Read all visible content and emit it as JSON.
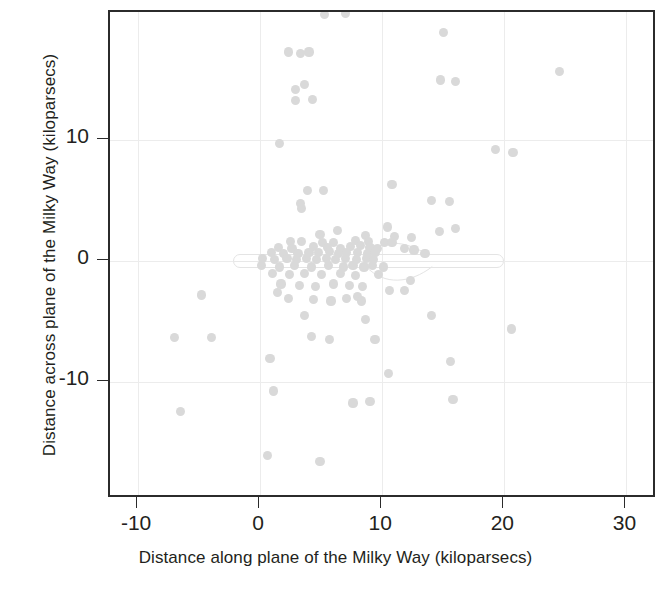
{
  "chart_data": {
    "type": "scatter",
    "title": "",
    "xlabel": "Distance along plane of the Milky Way (kiloparsecs)",
    "ylabel": "Distance across plane of the Milky Way (kiloparsecs)",
    "xlim": [
      -12.3,
      32.5
    ],
    "ylim": [
      -19.6,
      20.5
    ],
    "xticks": [
      -10,
      0,
      10,
      20,
      30
    ],
    "yticks": [
      10,
      0,
      -10
    ],
    "xticklabels": [
      "-10",
      "0",
      "10",
      "20",
      "30"
    ],
    "yticklabels": [
      "10",
      "0",
      "-10"
    ],
    "grid": true,
    "legend": null,
    "point_color": "#d9d9d9",
    "frame_color": "#2b2b2b",
    "grid_color": "#ececec",
    "overlay": {
      "name": "galactic-disk-outline",
      "shape": "elongated-capsule",
      "x_start": -2.2,
      "x_end": 20.0,
      "y_center": 0.0,
      "half_thickness": 0.55,
      "warp_feature_x": 9.5,
      "color": "#e4e4e4"
    },
    "points": [
      [
        5.3,
        20.3
      ],
      [
        7.0,
        20.4
      ],
      [
        15.0,
        18.8
      ],
      [
        2.3,
        17.2
      ],
      [
        4.0,
        17.2
      ],
      [
        3.3,
        17.1
      ],
      [
        24.5,
        15.6
      ],
      [
        16.0,
        14.8
      ],
      [
        3.6,
        14.5
      ],
      [
        14.8,
        14.9
      ],
      [
        2.9,
        14.1
      ],
      [
        4.3,
        13.3
      ],
      [
        2.9,
        13.2
      ],
      [
        1.6,
        9.7
      ],
      [
        20.7,
        8.9
      ],
      [
        19.3,
        9.2
      ],
      [
        10.8,
        6.3
      ],
      [
        3.9,
        5.8
      ],
      [
        5.2,
        5.8
      ],
      [
        14.0,
        5.0
      ],
      [
        15.5,
        4.9
      ],
      [
        3.3,
        4.7
      ],
      [
        3.4,
        4.3
      ],
      [
        16.0,
        2.7
      ],
      [
        14.7,
        2.4
      ],
      [
        10.4,
        2.8
      ],
      [
        6.3,
        2.5
      ],
      [
        4.9,
        2.2
      ],
      [
        8.6,
        2.1
      ],
      [
        11.0,
        2.0
      ],
      [
        12.4,
        1.9
      ],
      [
        2.5,
        1.6
      ],
      [
        3.4,
        1.6
      ],
      [
        5.1,
        1.5
      ],
      [
        6.0,
        1.5
      ],
      [
        7.8,
        1.7
      ],
      [
        8.9,
        1.6
      ],
      [
        10.2,
        1.5
      ],
      [
        10.8,
        1.5
      ],
      [
        1.5,
        1.1
      ],
      [
        2.6,
        1.0
      ],
      [
        4.4,
        1.2
      ],
      [
        5.5,
        1.1
      ],
      [
        6.6,
        1.0
      ],
      [
        7.4,
        1.2
      ],
      [
        8.2,
        1.3
      ],
      [
        9.0,
        1.1
      ],
      [
        9.6,
        1.0
      ],
      [
        11.8,
        1.0
      ],
      [
        12.6,
        0.9
      ],
      [
        0.9,
        0.7
      ],
      [
        1.9,
        0.6
      ],
      [
        3.1,
        0.6
      ],
      [
        4.0,
        0.7
      ],
      [
        4.8,
        0.7
      ],
      [
        5.7,
        0.8
      ],
      [
        6.4,
        0.6
      ],
      [
        7.1,
        0.7
      ],
      [
        8.0,
        0.7
      ],
      [
        8.8,
        0.6
      ],
      [
        9.4,
        0.7
      ],
      [
        13.5,
        0.6
      ],
      [
        0.2,
        0.2
      ],
      [
        1.2,
        0.1
      ],
      [
        2.2,
        0.2
      ],
      [
        3.0,
        0.1
      ],
      [
        3.8,
        0.2
      ],
      [
        4.6,
        0.1
      ],
      [
        5.4,
        0.2
      ],
      [
        6.2,
        0.1
      ],
      [
        7.0,
        0.2
      ],
      [
        7.9,
        0.1
      ],
      [
        8.7,
        0.2
      ],
      [
        9.3,
        0.1
      ],
      [
        0.1,
        -0.4
      ],
      [
        1.6,
        -0.5
      ],
      [
        2.8,
        -0.4
      ],
      [
        4.2,
        -0.5
      ],
      [
        5.6,
        -0.4
      ],
      [
        6.8,
        -0.5
      ],
      [
        7.6,
        -0.4
      ],
      [
        8.5,
        -0.5
      ],
      [
        9.2,
        -0.4
      ],
      [
        10.1,
        -0.5
      ],
      [
        1.0,
        -1.0
      ],
      [
        2.4,
        -1.1
      ],
      [
        3.6,
        -1.0
      ],
      [
        5.0,
        -1.1
      ],
      [
        6.6,
        -1.0
      ],
      [
        7.8,
        -1.2
      ],
      [
        9.7,
        -1.1
      ],
      [
        12.3,
        -1.6
      ],
      [
        1.7,
        -1.9
      ],
      [
        3.2,
        -2.0
      ],
      [
        4.5,
        -2.1
      ],
      [
        6.0,
        -1.9
      ],
      [
        7.3,
        -2.0
      ],
      [
        8.4,
        -2.1
      ],
      [
        10.6,
        -2.4
      ],
      [
        11.8,
        -2.4
      ],
      [
        1.4,
        -2.6
      ],
      [
        -4.8,
        -2.8
      ],
      [
        8.0,
        -2.9
      ],
      [
        8.3,
        -3.3
      ],
      [
        2.3,
        -3.1
      ],
      [
        4.4,
        -3.2
      ],
      [
        5.8,
        -3.3
      ],
      [
        7.1,
        -3.1
      ],
      [
        8.6,
        -4.8
      ],
      [
        14.0,
        -4.5
      ],
      [
        3.6,
        -4.5
      ],
      [
        4.2,
        -6.2
      ],
      [
        5.7,
        -6.5
      ],
      [
        -7.0,
        -6.3
      ],
      [
        -4.0,
        -6.3
      ],
      [
        9.4,
        -6.5
      ],
      [
        20.6,
        -5.6
      ],
      [
        0.8,
        -8.0
      ],
      [
        15.6,
        -8.3
      ],
      [
        10.5,
        -9.3
      ],
      [
        1.1,
        -10.7
      ],
      [
        7.6,
        -11.7
      ],
      [
        9.0,
        -11.6
      ],
      [
        15.8,
        -11.4
      ],
      [
        -6.5,
        -12.4
      ],
      [
        0.6,
        -16.0
      ],
      [
        4.9,
        -16.5
      ]
    ]
  }
}
